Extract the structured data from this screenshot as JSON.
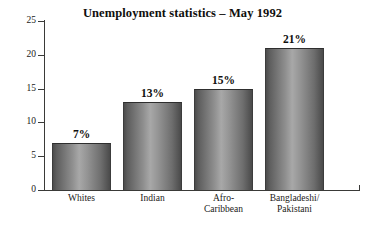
{
  "chart_data": {
    "type": "bar",
    "title": "Unemployment statistics – May 1992",
    "xlabel": "",
    "ylabel": "",
    "ylim": [
      0,
      25
    ],
    "yticks": [
      0,
      5,
      10,
      15,
      20,
      25
    ],
    "grid": false,
    "legend": "none",
    "categories": [
      "Whites",
      "Indian",
      "Afro-\nCaribbean",
      "Bangladeshi/\nPakistani"
    ],
    "values": [
      7,
      13,
      15,
      21
    ],
    "value_labels": [
      "7%",
      "13%",
      "15%",
      "21%"
    ],
    "units": "percent"
  },
  "axes": {
    "y_tick_labels": [
      "0",
      "5",
      "10",
      "15",
      "20",
      "25"
    ]
  },
  "colors": {
    "background": "#ffffff",
    "axis": "#3a3a38",
    "text": "#100f0d",
    "bar_dark": "#4a4a4a",
    "bar_light": "#a8a8a8"
  }
}
